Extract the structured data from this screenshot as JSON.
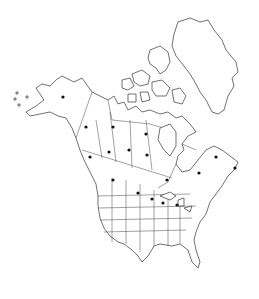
{
  "map": {
    "type": "distribution-map",
    "region": "North America",
    "dot_color": "#111111",
    "line_color": "#333333",
    "background": "#ffffff",
    "occurrence_dots": [
      {
        "region": "Alaska",
        "x": 63,
        "y": 97
      },
      {
        "region": "Yukon",
        "x": 86,
        "y": 127
      },
      {
        "region": "Northwest Territories",
        "x": 113,
        "y": 127
      },
      {
        "region": "Nunavut",
        "x": 146,
        "y": 134
      },
      {
        "region": "British Columbia",
        "x": 90,
        "y": 157
      },
      {
        "region": "Alberta",
        "x": 109,
        "y": 152
      },
      {
        "region": "Saskatchewan",
        "x": 129,
        "y": 150
      },
      {
        "region": "Manitoba",
        "x": 147,
        "y": 155
      },
      {
        "region": "Ontario",
        "x": 167,
        "y": 180
      },
      {
        "region": "Quebec",
        "x": 199,
        "y": 173
      },
      {
        "region": "Labrador",
        "x": 216,
        "y": 157
      },
      {
        "region": "Newfoundland",
        "x": 235,
        "y": 168
      },
      {
        "region": "Montana",
        "x": 113,
        "y": 180
      },
      {
        "region": "North Dakota",
        "x": 138,
        "y": 193
      },
      {
        "region": "Minnesota",
        "x": 152,
        "y": 199
      },
      {
        "region": "Wisconsin",
        "x": 163,
        "y": 203
      },
      {
        "region": "Michigan",
        "x": 177,
        "y": 205
      }
    ]
  }
}
